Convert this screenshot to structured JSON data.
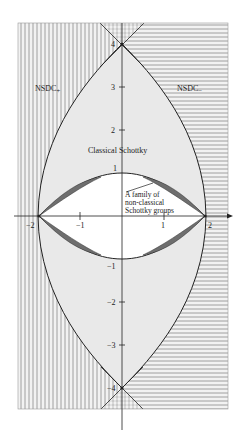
{
  "figure": {
    "type": "parameter-space diagram",
    "regions": {
      "left": "NSDC+",
      "right": "NSDC−",
      "outer_lens": "Classical Schottky",
      "crescents": "A family of non-classical Schottky groups"
    },
    "labels": {
      "nsdc_plus_main": "NSDC",
      "nsdc_plus_sub": "+",
      "nsdc_minus_main": "NSDC",
      "nsdc_minus_sub": "−",
      "classical": "Classical Schottky",
      "family_line1": "A family of",
      "family_line2": "non-classical",
      "family_line3": "Schottky groups"
    },
    "x_ticks": [
      "−2",
      "−1",
      "1",
      "2"
    ],
    "y_ticks": [
      "4",
      "3",
      "2",
      "1",
      "−1",
      "−2",
      "−3",
      "−4"
    ],
    "colors": {
      "hatch": "#8a8a8a",
      "classical_fill": "#e9e9e9",
      "crescent_fill": "#6e6e6e",
      "inner_fill": "#ffffff",
      "curve": "#222222"
    }
  }
}
